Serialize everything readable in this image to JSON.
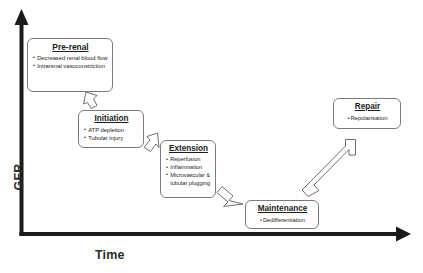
{
  "figure": {
    "axes": {
      "y_label": "GFR",
      "x_label": "Time"
    },
    "boxes": [
      {
        "id": "prerenal",
        "title": "Pre-renal",
        "items": [
          "Decreased renal blood flow",
          "Intrarenal vasoconstriction"
        ]
      },
      {
        "id": "initiation",
        "title": "Initiation",
        "items": [
          "ATP depletion",
          "Tubular injury"
        ]
      },
      {
        "id": "extension",
        "title": "Extension",
        "items": [
          "Reperfusion",
          "Inflammation",
          "Microvascular & tubular plugging"
        ]
      },
      {
        "id": "maintenance",
        "title": "Maintenance",
        "items": [
          "Dedifferentiation"
        ]
      },
      {
        "id": "repair",
        "title": "Repair",
        "items": [
          "Repolarisation"
        ]
      }
    ],
    "caption_fragment": ""
  },
  "colors": {
    "axis": "#1a1a1a",
    "box_border": "#7a7a7a",
    "text": "#1c1c1c",
    "background": "#ffffff"
  }
}
